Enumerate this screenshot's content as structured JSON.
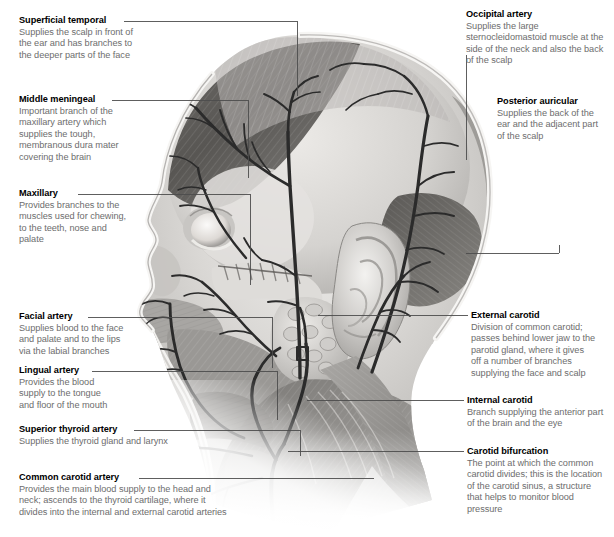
{
  "figure": {
    "kind": "anatomical-illustration",
    "style": "grayscale medical illustration, left-facing profile"
  },
  "palette": {
    "title_color": "#000000",
    "body_color": "#6d6d6d",
    "leader_color": "#4d4d4d",
    "background": "#ffffff",
    "artery_dark": "#2e2e2e",
    "skin_light": "#e8e6e3",
    "muscle_mid": "#8f8d8a",
    "shadow_dark": "#4a4845"
  },
  "labels_left": [
    {
      "id": "superficial-temporal",
      "title": "Superficial temporal",
      "body": "Supplies the scalp in front of\nthe ear and has branches to\nthe deeper parts of the face"
    },
    {
      "id": "middle-meningeal",
      "title": "Middle meningeal",
      "body": "Important branch of the\nmaxillary artery which\nsupplies the tough,\nmembranous dura mater\ncovering the brain"
    },
    {
      "id": "maxillary",
      "title": "Maxillary",
      "body": "Provides branches to the\nmuscles used for chewing,\nto the teeth, nose and\npalate"
    },
    {
      "id": "facial-artery",
      "title": "Facial artery",
      "body": "Supplies blood to the face\nand palate and to the lips\nvia the labial branches"
    },
    {
      "id": "lingual-artery",
      "title": "Lingual artery",
      "body": "Provides the blood\nsupply to the tongue\nand floor of the mouth"
    },
    {
      "id": "superior-thyroid-artery",
      "title": "Superior thyroid artery",
      "body": "Supplies the thyroid gland and larynx"
    },
    {
      "id": "common-carotid-artery",
      "title": "Common carotid artery",
      "body": "Provides the main blood supply to the head and\nneck; ascends to the thyroid cartilage, where it\ndivides into the internal and external carotid arteries"
    }
  ],
  "labels_right": [
    {
      "id": "occipital-artery",
      "title": "Occipital artery",
      "body": "Supplies the large\nsternocleidomastoid muscle at the\nside of the neck and also the back\nof the scalp"
    },
    {
      "id": "posterior-auricular",
      "title": "Posterior auricular",
      "body": "Supplies the back of the\near and the adjacent part\nof the scalp"
    },
    {
      "id": "external-carotid",
      "title": "External carotid",
      "body": "Division of common carotid;\npasses behind lower jaw to the\nparotid gland, where it gives\noff a number of branches\nsupplying the face and scalp"
    },
    {
      "id": "internal-carotid",
      "title": "Internal carotid",
      "body": "Branch supplying the anterior part\nof the brain and the eye"
    },
    {
      "id": "carotid-bifurcation",
      "title": "Carotid bifurcation",
      "body": "The point at which the common\ncarotid divides; this is the location\nof the carotid sinus, a structure\nthat helps to monitor blood\npressure"
    }
  ]
}
